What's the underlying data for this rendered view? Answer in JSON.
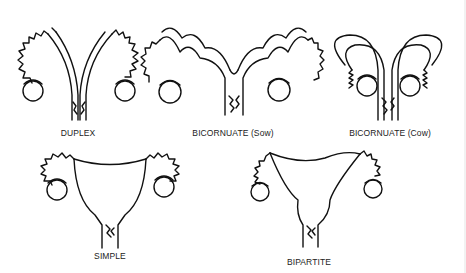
{
  "diagram": {
    "type": "anatomical line drawing",
    "panels": [
      {
        "id": "duplex",
        "label": "DUPLEX"
      },
      {
        "id": "bicornuate-sow",
        "label": "BICORNUATE (Sow)"
      },
      {
        "id": "bicornuate-cow",
        "label": "BICORNUATE (Cow)"
      },
      {
        "id": "simple",
        "label": "SIMPLE"
      },
      {
        "id": "bipartite",
        "label": "BIPARTITE"
      }
    ]
  }
}
